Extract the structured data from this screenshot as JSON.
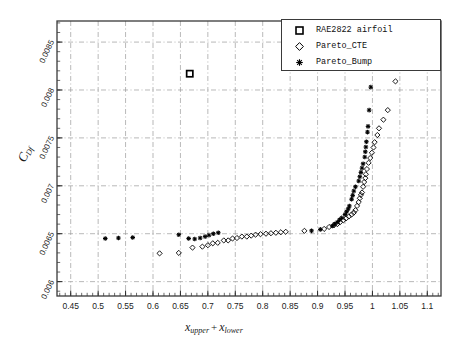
{
  "figure": {
    "background": "#ffffff",
    "frame_color": "#3a3a3a",
    "grid_color": "#999999"
  },
  "legend": {
    "items": [
      {
        "label": "RAE2822 airfoil",
        "marker": "square-marker"
      },
      {
        "label": "Pareto_CTE",
        "marker": "diamond-marker"
      },
      {
        "label": "Pareto_Bump",
        "marker": "asterisk-marker"
      }
    ]
  },
  "axes": {
    "xlabel_main": "x",
    "xlabel_sub1": "upper",
    "xlabel_plus": "+",
    "xlabel_main2": "x",
    "xlabel_sub2": "lower",
    "ylabel_main": "C",
    "ylabel_sub": "Df",
    "xticks": [
      "0.45",
      "0.5",
      "0.55",
      "0.6",
      "0.65",
      "0.7",
      "0.75",
      "0.8",
      "0.85",
      "0.9",
      "0.95",
      "1",
      "1.05",
      "1.1"
    ],
    "yticks": [
      "0.006",
      "0.0065",
      "0.007",
      "0.0075",
      "0.008",
      "0.0085"
    ]
  },
  "chart_data": {
    "type": "scatter",
    "title": "",
    "xlabel": "x_upper + x_lower",
    "ylabel": "C_Df",
    "xlim": [
      0.425,
      1.125
    ],
    "ylim": [
      0.00585,
      0.00872
    ],
    "xtick_values": [
      0.45,
      0.5,
      0.55,
      0.6,
      0.65,
      0.7,
      0.75,
      0.8,
      0.85,
      0.9,
      0.95,
      1.0,
      1.05,
      1.1
    ],
    "ytick_values": [
      0.006,
      0.0065,
      0.007,
      0.0075,
      0.008,
      0.0085
    ],
    "grid": true,
    "grid_style": "dash-dot",
    "legend_position": "top-right",
    "series": [
      {
        "name": "RAE2822 airfoil",
        "marker": "square",
        "filled": false,
        "color": "#000000",
        "points": [
          [
            0.667,
            0.00817
          ]
        ]
      },
      {
        "name": "Pareto_CTE",
        "marker": "diamond",
        "filled": false,
        "color": "#000000",
        "points": [
          [
            0.612,
            0.006295
          ],
          [
            0.647,
            0.0063
          ],
          [
            0.672,
            0.006355
          ],
          [
            0.69,
            0.006365
          ],
          [
            0.7,
            0.00638
          ],
          [
            0.709,
            0.0064
          ],
          [
            0.718,
            0.006405
          ],
          [
            0.729,
            0.00643
          ],
          [
            0.737,
            0.00643
          ],
          [
            0.745,
            0.00645
          ],
          [
            0.753,
            0.006455
          ],
          [
            0.762,
            0.00647
          ],
          [
            0.771,
            0.00647
          ],
          [
            0.779,
            0.00648
          ],
          [
            0.787,
            0.00649
          ],
          [
            0.796,
            0.006495
          ],
          [
            0.806,
            0.0065
          ],
          [
            0.815,
            0.006505
          ],
          [
            0.824,
            0.00651
          ],
          [
            0.833,
            0.006515
          ],
          [
            0.842,
            0.00652
          ],
          [
            0.876,
            0.00653
          ],
          [
            0.912,
            0.00655
          ],
          [
            0.921,
            0.00657
          ],
          [
            0.93,
            0.00659
          ],
          [
            0.936,
            0.0066
          ],
          [
            0.941,
            0.00662
          ],
          [
            0.947,
            0.00664
          ],
          [
            0.952,
            0.00666
          ],
          [
            0.957,
            0.00668
          ],
          [
            0.962,
            0.0067
          ],
          [
            0.966,
            0.00672
          ],
          [
            0.969,
            0.006745
          ],
          [
            0.972,
            0.00679
          ],
          [
            0.975,
            0.00683
          ],
          [
            0.977,
            0.00687
          ],
          [
            0.979,
            0.006905
          ],
          [
            0.981,
            0.00693
          ],
          [
            0.983,
            0.00699
          ],
          [
            0.985,
            0.00704
          ],
          [
            0.987,
            0.00708
          ],
          [
            0.988,
            0.00712
          ],
          [
            0.99,
            0.007175
          ],
          [
            0.993,
            0.00724
          ],
          [
            0.996,
            0.00729
          ],
          [
            0.999,
            0.007345
          ],
          [
            1.002,
            0.0074
          ],
          [
            1.004,
            0.007455
          ],
          [
            1.009,
            0.00753
          ],
          [
            1.012,
            0.0076
          ],
          [
            1.02,
            0.00769
          ],
          [
            1.028,
            0.00779
          ],
          [
            1.042,
            0.00809
          ]
        ]
      },
      {
        "name": "Pareto_Bump",
        "marker": "asterisk",
        "filled": true,
        "color": "#000000",
        "points": [
          [
            0.513,
            0.00645
          ],
          [
            0.537,
            0.006455
          ],
          [
            0.563,
            0.00646
          ],
          [
            0.647,
            0.00649
          ],
          [
            0.665,
            0.00645
          ],
          [
            0.676,
            0.006445
          ],
          [
            0.686,
            0.006455
          ],
          [
            0.695,
            0.00647
          ],
          [
            0.702,
            0.006485
          ],
          [
            0.71,
            0.0065
          ],
          [
            0.719,
            0.00651
          ],
          [
            0.889,
            0.00653
          ],
          [
            0.905,
            0.006545
          ],
          [
            0.927,
            0.00658
          ],
          [
            0.931,
            0.0066
          ],
          [
            0.936,
            0.00662
          ],
          [
            0.94,
            0.006645
          ],
          [
            0.944,
            0.006665
          ],
          [
            0.95,
            0.0067
          ],
          [
            0.953,
            0.00673
          ],
          [
            0.956,
            0.00676
          ],
          [
            0.958,
            0.00679
          ],
          [
            0.962,
            0.00686
          ],
          [
            0.964,
            0.0069
          ],
          [
            0.966,
            0.006945
          ],
          [
            0.969,
            0.00699
          ],
          [
            0.975,
            0.00705
          ],
          [
            0.977,
            0.007095
          ],
          [
            0.979,
            0.00714
          ],
          [
            0.981,
            0.007185
          ],
          [
            0.983,
            0.00723
          ],
          [
            0.986,
            0.0073
          ],
          [
            0.987,
            0.007355
          ],
          [
            0.988,
            0.007405
          ],
          [
            0.989,
            0.00746
          ],
          [
            0.991,
            0.00756
          ],
          [
            0.992,
            0.00762
          ],
          [
            0.994,
            0.00779
          ],
          [
            0.997,
            0.00803
          ]
        ]
      }
    ]
  }
}
